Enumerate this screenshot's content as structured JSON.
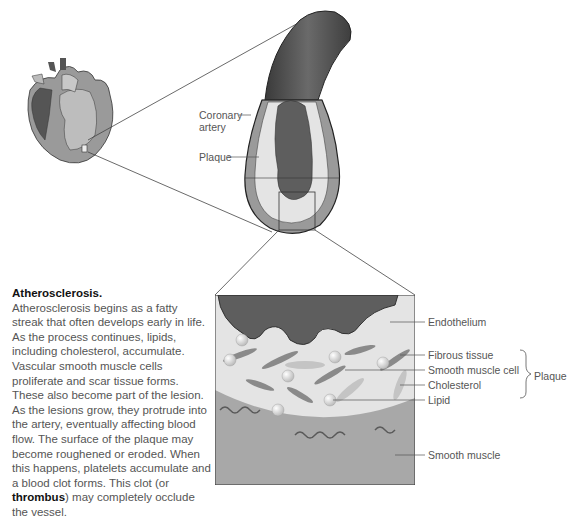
{
  "diagram": {
    "callout_labels": {
      "coronary_artery": [
        "Coronary",
        "artery"
      ],
      "plaque": "Plaque"
    },
    "detail_labels": [
      {
        "id": "endothelium",
        "text": "Endothelium"
      },
      {
        "id": "fibrous-tissue",
        "text": "Fibrous tissue"
      },
      {
        "id": "smooth-muscle-cell",
        "text": "Smooth muscle cell"
      },
      {
        "id": "cholesterol",
        "text": "Cholesterol"
      },
      {
        "id": "lipid",
        "text": "Lipid"
      },
      {
        "id": "smooth-muscle",
        "text": "Smooth muscle"
      }
    ],
    "bracket_label": "Plaque",
    "illustrations": [
      "heart",
      "coronary-artery-cross-section",
      "plaque-detail-magnified"
    ]
  },
  "caption": {
    "title": "Atherosclerosis.",
    "body_before": "Atherosclerosis begins as a fatty streak that often develops early in life. As the process continues, lipids, including cholesterol, accumulate. Vascular smooth muscle cells proliferate and scar tissue forms. These also become part of the lesion. As the lesions grow, they protrude into the artery, eventually affecting blood flow. The surface of the plaque may become roughened or eroded. When this happens, platelets accumulate and a blood clot forms. This clot (or ",
    "bold_term": "thrombus",
    "body_after": ") may completely occlude the vessel."
  },
  "colors": {
    "lumen": "#5e5e5e",
    "artery_wall": "#9a9a9a",
    "plaque": "#e4e4e4",
    "smooth_muscle": "#a8a8a8",
    "outline": "#333333"
  }
}
